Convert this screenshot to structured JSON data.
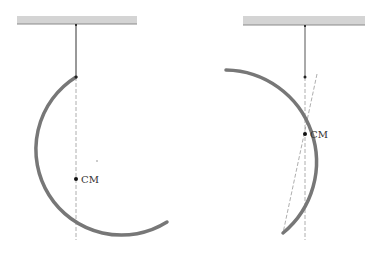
{
  "figures": [
    {
      "id": "left",
      "description": "Semicircular hoop hanging at equilibrium",
      "ceiling": {
        "x": 17,
        "y": 16,
        "width": 120,
        "height": 8
      },
      "string": {
        "x": 76,
        "y1": 24,
        "y2": 77
      },
      "pivot": {
        "x": 76,
        "y": 77
      },
      "arc": {
        "path": "M 76 77 A 80 80 0 1 0 167 222"
      },
      "vertical_dashed": {
        "x": 76,
        "y1": 77,
        "y2": 240
      },
      "cm": {
        "x": 76,
        "y": 179,
        "label": "CM"
      },
      "stray_dot": {
        "x": 97,
        "y": 161
      }
    },
    {
      "id": "right",
      "description": "Hoop displaced, CM below pivot on vertical",
      "ceiling": {
        "x": 243,
        "y": 16,
        "width": 122,
        "height": 9
      },
      "string": {
        "x": 305,
        "y1": 25,
        "y2": 77
      },
      "pivot": {
        "x": 305,
        "y": 77
      },
      "arc": {
        "path": "M 226 70 A 92 92 0 0 1 283 233"
      },
      "vertical_dashed": {
        "x": 305,
        "y1": 77,
        "y2": 240
      },
      "tilted_dashed": {
        "x1": 317,
        "y1": 74,
        "x2": 283,
        "y2": 233
      },
      "cm": {
        "x": 305,
        "y": 134,
        "label": "CM"
      }
    }
  ],
  "colors": {
    "ceiling_fill": "#d4d4d4",
    "ceiling_edge": "#8a8a8a",
    "string": "#333333",
    "hoop": "#777777",
    "dashed": "#999999",
    "cm_dot": "#111111"
  }
}
